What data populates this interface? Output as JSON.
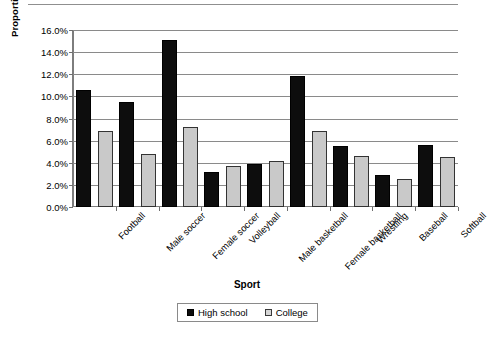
{
  "chart_data": {
    "type": "bar",
    "title": "",
    "xlabel": "Sport",
    "ylabel": "Proportion of Total Injuries",
    "ylim": [
      0,
      16
    ],
    "ytick_labels": [
      "16.0%",
      "14.0%",
      "12.0%",
      "10.0%",
      "8.0%",
      "6.0%",
      "4.0%",
      "2.0%",
      "0.0%"
    ],
    "ytick_values": [
      16,
      14,
      12,
      10,
      8,
      6,
      4,
      2,
      0
    ],
    "grid": true,
    "legend_position": "bottom-center",
    "categories": [
      "Football",
      "Male soccer",
      "Female soccer",
      "Volleyball",
      "Male basketball",
      "Female basketball",
      "Wrestling",
      "Baseball",
      "Softball"
    ],
    "series": [
      {
        "name": "High school",
        "color": "#0d0d0d",
        "values": [
          10.6,
          9.5,
          15.1,
          3.2,
          3.9,
          11.8,
          5.5,
          2.9,
          5.6
        ]
      },
      {
        "name": "College",
        "color": "#c9c9c9",
        "values": [
          6.9,
          4.8,
          7.2,
          3.7,
          4.2,
          6.9,
          4.6,
          2.5,
          4.5
        ]
      }
    ]
  },
  "legend": {
    "entries": [
      {
        "label": "High school",
        "swatch": "black-square-icon"
      },
      {
        "label": "College",
        "swatch": "gray-square-icon"
      }
    ]
  }
}
